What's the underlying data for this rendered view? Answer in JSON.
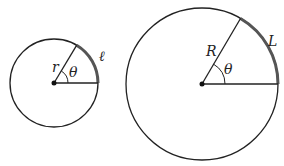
{
  "diagram": {
    "small_circle": {
      "radius_label": "r",
      "angle_label": "θ",
      "arc_label": "ℓ"
    },
    "large_circle": {
      "radius_label": "R",
      "angle_label": "θ",
      "arc_label": "L"
    },
    "colors": {
      "stroke": "#222222",
      "arc": "#555555"
    }
  }
}
